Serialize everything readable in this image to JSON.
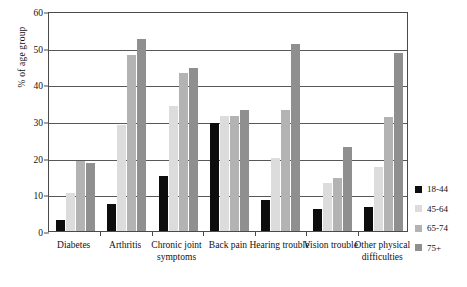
{
  "chart_data": {
    "type": "bar",
    "title": "",
    "xlabel": "",
    "ylabel": "% of age group",
    "ylim": [
      0,
      60
    ],
    "yticks": [
      0,
      10,
      20,
      30,
      40,
      50,
      60
    ],
    "grid": "horizontal",
    "legend_position": "right",
    "categories": [
      "Diabetes",
      "Arthritis",
      "Chronic joint symptoms",
      "Back pain",
      "Hearing trouble",
      "Vision trouble",
      "Other physical difficulties"
    ],
    "series": [
      {
        "name": "18-44",
        "color": "#0d0d0d",
        "values": [
          3,
          7.5,
          15,
          29.5,
          8.5,
          6,
          6.5
        ]
      },
      {
        "name": "45-64",
        "color": "#dcdcdc",
        "values": [
          10.5,
          29,
          34,
          31.5,
          20,
          13,
          17.5
        ]
      },
      {
        "name": "65-74",
        "color": "#b3b3b3",
        "values": [
          19,
          48,
          43,
          31.5,
          33,
          14.5,
          31
        ]
      },
      {
        "name": "75+",
        "color": "#8f8f8f",
        "values": [
          18.5,
          52.5,
          44.5,
          33,
          51,
          23,
          48.5
        ]
      }
    ]
  },
  "legend": {
    "items": [
      {
        "label": "18-44"
      },
      {
        "label": "45-64"
      },
      {
        "label": "65-74"
      },
      {
        "label": "75+"
      }
    ]
  }
}
